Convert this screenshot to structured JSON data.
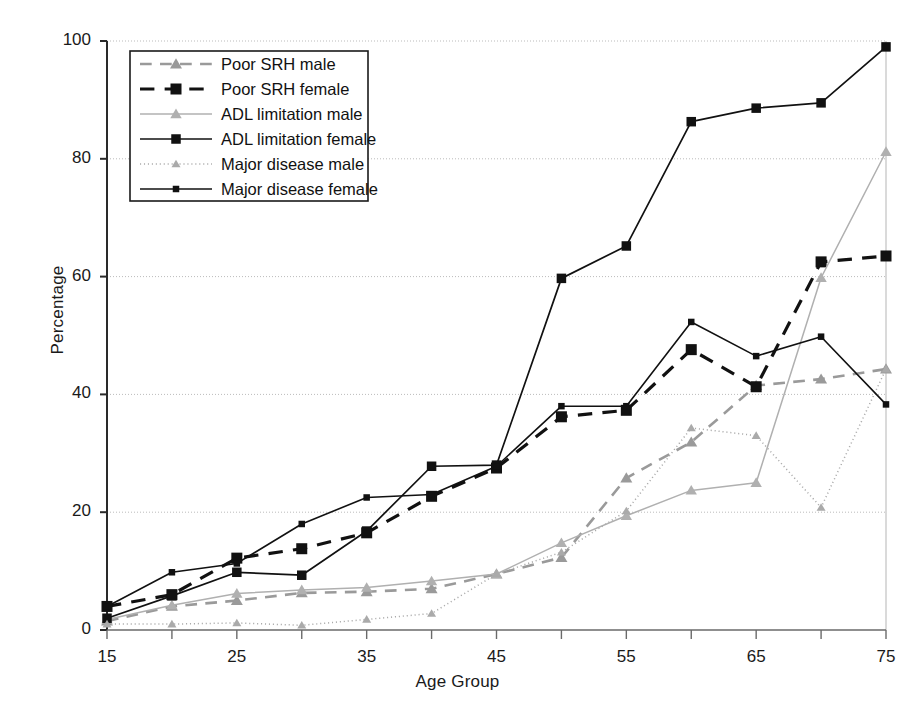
{
  "chart_data": {
    "type": "line",
    "title": "",
    "xlabel": "Age Group",
    "ylabel": "Percentage",
    "xlim": [
      15,
      75
    ],
    "ylim": [
      0,
      100
    ],
    "grid": true,
    "legend_position": "top-left",
    "x": [
      15,
      20,
      25,
      30,
      35,
      40,
      45,
      50,
      55,
      60,
      65,
      70,
      75
    ],
    "xtick_labels": [
      "15",
      "",
      "25",
      "",
      "35",
      "",
      "45",
      "",
      "55",
      "",
      "65",
      "",
      "75"
    ],
    "ytick_labels": [
      "0",
      "20",
      "40",
      "60",
      "80",
      "100"
    ],
    "ytick_values": [
      0,
      20,
      40,
      60,
      80,
      100
    ],
    "series": [
      {
        "name": "Poor SRH male",
        "marker": "triangle",
        "linestyle": "dashed",
        "color": "#9a9a9a",
        "values": [
          1.5,
          4.0,
          5.0,
          6.3,
          6.5,
          7.0,
          9.5,
          12.3,
          25.8,
          31.9,
          41.5,
          42.6,
          44.3
        ]
      },
      {
        "name": "Poor SRH female",
        "marker": "square",
        "linestyle": "dashed",
        "color": "#111111",
        "values": [
          4.0,
          6.0,
          12.2,
          13.8,
          16.5,
          22.7,
          27.5,
          36.2,
          37.3,
          47.6,
          41.3,
          62.5,
          63.5
        ]
      },
      {
        "name": "ADL limitation male",
        "marker": "triangle",
        "linestyle": "solid",
        "color": "#b0b0b0",
        "values": [
          1.8,
          4.2,
          6.2,
          6.8,
          7.2,
          8.3,
          9.5,
          14.8,
          19.4,
          23.7,
          25.0,
          59.8,
          81.2
        ]
      },
      {
        "name": "ADL limitation female",
        "marker": "square",
        "linestyle": "solid",
        "color": "#111111",
        "values": [
          2.0,
          5.8,
          9.8,
          9.3,
          16.8,
          27.8,
          28.0,
          59.7,
          65.2,
          86.3,
          88.6,
          89.5,
          99.0
        ]
      },
      {
        "name": "Major disease male",
        "marker": "triangle",
        "linestyle": "dotted",
        "color": "#aaaaaa",
        "values": [
          1.0,
          1.0,
          1.2,
          0.8,
          1.8,
          2.8,
          9.5,
          13.2,
          20.2,
          34.3,
          33.0,
          20.8,
          44.3
        ]
      },
      {
        "name": "Major disease female",
        "marker": "square",
        "linestyle": "solid",
        "color": "#111111",
        "values": [
          4.0,
          9.8,
          11.3,
          18.0,
          22.5,
          23.0,
          27.8,
          38.0,
          38.0,
          52.3,
          46.5,
          49.8,
          38.3
        ]
      }
    ]
  }
}
